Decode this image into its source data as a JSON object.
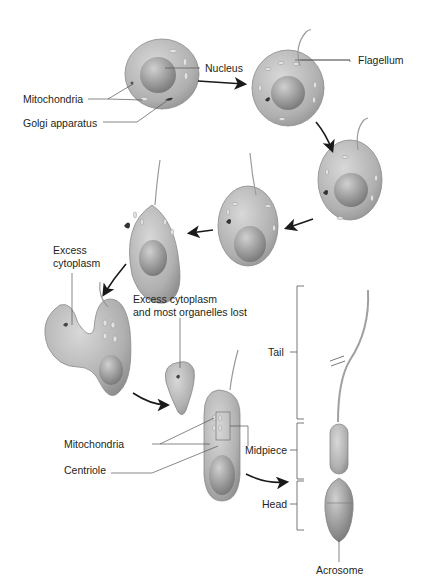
{
  "colors": {
    "background": "#ffffff",
    "cell_fill": "#b4b4b4",
    "cell_edge": "#8a8a8a",
    "nucleus": "#9a9a9a",
    "label_text": "#231f20",
    "leader_line": "#555555",
    "arrow": "#1a1a1a"
  },
  "labels": {
    "nucleus": "Nucleus",
    "flagellum": "Flagellum",
    "mitochondria_top": "Mitochondria",
    "golgi": "Golgi apparatus",
    "excess_cytoplasm_1": "Excess",
    "excess_cytoplasm_2": "cytoplasm",
    "excess_lost_1": "Excess cytoplasm",
    "excess_lost_2": "and most organelles lost",
    "mitochondria_bottom": "Mitochondria",
    "centriole": "Centriole",
    "tail": "Tail",
    "midpiece": "Midpiece",
    "head": "Head",
    "acrosome": "Acrosome"
  },
  "stages": [
    {
      "id": 1,
      "name": "round spermatid"
    },
    {
      "id": 2,
      "name": "flagellum forming"
    },
    {
      "id": 3,
      "name": "elongating spermatid"
    },
    {
      "id": 4,
      "name": "elongating spermatid"
    },
    {
      "id": 5,
      "name": "elongating spermatid"
    },
    {
      "id": 6,
      "name": "cytoplasm shedding"
    },
    {
      "id": 7,
      "name": "residual body"
    },
    {
      "id": 8,
      "name": "late spermatid"
    },
    {
      "id": 9,
      "name": "mature sperm"
    }
  ]
}
